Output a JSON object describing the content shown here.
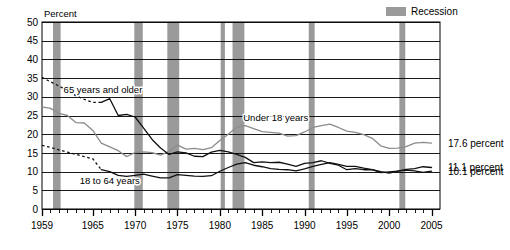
{
  "chart_data": {
    "type": "line",
    "title": "",
    "xlabel": "",
    "ylabel": "Percent",
    "ylim": [
      0,
      50
    ],
    "xlim": [
      1959,
      2006
    ],
    "ytick_step": 5,
    "yticks": [
      "0",
      "5",
      "10",
      "15",
      "20",
      "25",
      "30",
      "35",
      "40",
      "45",
      "50"
    ],
    "xticks": [
      "1959",
      "1965",
      "1970",
      "1975",
      "1980",
      "1985",
      "1990",
      "1995",
      "2000",
      "2005"
    ],
    "xtick_values": [
      1959,
      1965,
      1970,
      1975,
      1980,
      1985,
      1990,
      1995,
      2000,
      2005
    ],
    "minor_xtick_interval": 1,
    "grid": "horizontal",
    "legend_position": "top-right",
    "legend": [
      {
        "label": "Recession",
        "swatch_color": "#9a9a9a",
        "kind": "band"
      }
    ],
    "annotations": [
      {
        "text": "65 years and older",
        "x": 1966.2,
        "y": 31.0,
        "series": "65 years and older"
      },
      {
        "text": "Under 18 years",
        "x": 1986.6,
        "y": 23.4,
        "series": "Under 18 years"
      },
      {
        "text": "18 to 64 years",
        "x": 1967.0,
        "y": 6.6,
        "series": "18 to 64 years"
      }
    ],
    "end_labels": [
      {
        "text": "17.6 percent",
        "series": "Under 18 years",
        "value": 17.6,
        "x": 2005
      },
      {
        "text": "11.1 percent",
        "series": "18 to 64 years",
        "value": 11.1,
        "x": 2005
      },
      {
        "text": "10.1 percent",
        "series": "65 years and older",
        "value": 10.1,
        "x": 2005
      }
    ],
    "recession_bands": [
      {
        "start": 1960.3,
        "end": 1961.2
      },
      {
        "start": 1969.9,
        "end": 1970.9
      },
      {
        "start": 1973.8,
        "end": 1975.2
      },
      {
        "start": 1980.1,
        "end": 1980.6
      },
      {
        "start": 1981.5,
        "end": 1982.9
      },
      {
        "start": 1990.5,
        "end": 1991.2
      },
      {
        "start": 2001.2,
        "end": 2001.9
      }
    ],
    "series": [
      {
        "name": "Under 18 years",
        "color": "#8c8c8c",
        "width": 1.3,
        "style": "solid",
        "x": [
          1959,
          1960,
          1961,
          1962,
          1963,
          1964,
          1965,
          1966,
          1967,
          1968,
          1969,
          1970,
          1971,
          1972,
          1973,
          1974,
          1975,
          1976,
          1977,
          1978,
          1979,
          1980,
          1981,
          1982,
          1983,
          1984,
          1985,
          1986,
          1987,
          1988,
          1989,
          1990,
          1991,
          1992,
          1993,
          1994,
          1995,
          1996,
          1997,
          1998,
          1999,
          2000,
          2001,
          2002,
          2003,
          2004,
          2005
        ],
        "values": [
          27.3,
          26.9,
          25.6,
          25.0,
          23.1,
          23.0,
          21.0,
          17.6,
          16.6,
          15.6,
          14.0,
          15.1,
          15.3,
          15.1,
          14.4,
          15.4,
          17.1,
          16.0,
          16.2,
          15.9,
          16.4,
          18.3,
          20.0,
          21.9,
          22.3,
          21.5,
          20.7,
          20.5,
          20.3,
          19.5,
          19.6,
          20.6,
          21.8,
          22.3,
          22.7,
          21.8,
          20.8,
          20.5,
          19.9,
          18.9,
          16.9,
          16.2,
          16.3,
          16.7,
          17.6,
          17.8,
          17.6
        ]
      },
      {
        "name": "18 to 64 years",
        "color": "#111111",
        "width": 1.3,
        "style": "solid-with-dashed-head",
        "dashed_until": 1966,
        "x": [
          1959,
          1960,
          1961,
          1962,
          1963,
          1964,
          1965,
          1966,
          1967,
          1968,
          1969,
          1970,
          1971,
          1972,
          1973,
          1974,
          1975,
          1976,
          1977,
          1978,
          1979,
          1980,
          1981,
          1982,
          1983,
          1984,
          1985,
          1986,
          1987,
          1988,
          1989,
          1990,
          1991,
          1992,
          1993,
          1994,
          1995,
          1996,
          1997,
          1998,
          1999,
          2000,
          2001,
          2002,
          2003,
          2004,
          2005
        ],
        "values": [
          17.0,
          16.5,
          15.8,
          15.2,
          14.6,
          14.0,
          13.4,
          10.5,
          10.0,
          9.0,
          8.7,
          9.0,
          9.3,
          8.8,
          8.3,
          8.3,
          9.2,
          9.0,
          8.8,
          8.7,
          8.9,
          10.1,
          11.1,
          12.0,
          12.4,
          11.7,
          11.3,
          10.8,
          10.6,
          10.5,
          10.2,
          10.7,
          11.4,
          11.9,
          12.4,
          11.9,
          11.4,
          11.4,
          10.9,
          10.5,
          10.0,
          9.6,
          10.1,
          10.6,
          10.8,
          11.3,
          11.1
        ]
      },
      {
        "name": "65 years and older",
        "color": "#111111",
        "width": 1.3,
        "style": "solid-with-dashed-head",
        "dashed_until": 1966,
        "x": [
          1959,
          1960,
          1961,
          1962,
          1963,
          1964,
          1965,
          1966,
          1967,
          1968,
          1969,
          1970,
          1971,
          1972,
          1973,
          1974,
          1975,
          1976,
          1977,
          1978,
          1979,
          1980,
          1981,
          1982,
          1983,
          1984,
          1985,
          1986,
          1987,
          1988,
          1989,
          1990,
          1991,
          1992,
          1993,
          1994,
          1995,
          1996,
          1997,
          1998,
          1999,
          2000,
          2001,
          2002,
          2003,
          2004,
          2005
        ],
        "values": [
          35.2,
          34.0,
          32.9,
          31.6,
          30.3,
          29.3,
          28.5,
          28.5,
          29.5,
          25.0,
          25.3,
          24.6,
          21.6,
          18.6,
          16.3,
          14.6,
          15.3,
          15.0,
          14.1,
          14.0,
          15.2,
          15.7,
          15.3,
          14.6,
          13.8,
          12.4,
          12.6,
          12.4,
          12.5,
          12.0,
          11.4,
          12.2,
          12.4,
          12.9,
          12.2,
          11.7,
          10.5,
          10.8,
          10.5,
          10.5,
          9.7,
          9.9,
          10.1,
          10.4,
          10.2,
          9.8,
          10.1
        ]
      }
    ]
  },
  "axis": {
    "ylabel": "Percent"
  },
  "legend": {
    "recession_label": "Recession"
  },
  "colors": {
    "recession_band": "#9a9a9a",
    "gridline": "#000000",
    "under18_line": "#8c8c8c",
    "other_lines": "#111111",
    "background": "#ffffff"
  }
}
